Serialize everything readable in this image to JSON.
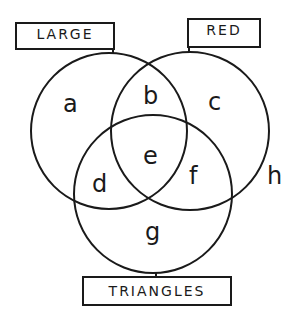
{
  "diagram": {
    "type": "venn",
    "sets": [
      {
        "id": "large",
        "label": "LARGE"
      },
      {
        "id": "red",
        "label": "RED"
      },
      {
        "id": "triangles",
        "label": "TRIANGLES"
      }
    ],
    "regions": {
      "a": "a",
      "b": "b",
      "c": "c",
      "d": "d",
      "e": "e",
      "f": "f",
      "g": "g",
      "h": "h"
    },
    "line_color": "#1a1a1a",
    "background": "#ffffff"
  }
}
